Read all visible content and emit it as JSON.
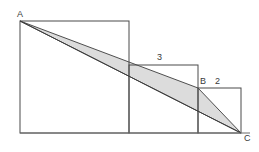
{
  "figure": {
    "background_color": "#ffffff",
    "stroke_color": "#4a4a4a",
    "shade_color": "#dcdcdc",
    "shade_stroke_color": "#3c3c3c",
    "vertices": {
      "A": {
        "label": "A",
        "x": 20,
        "y": 21
      },
      "B": {
        "label": "B",
        "x": 198,
        "y": 88
      },
      "C": {
        "label": "C",
        "x": 241,
        "y": 133
      }
    },
    "side_labels": {
      "medium_square": "3",
      "small_square": "2"
    },
    "squares": [
      {
        "name": "large-square",
        "x": 20,
        "y": 21,
        "width": 109,
        "height": 112
      },
      {
        "name": "medium-square",
        "x": 129,
        "y": 65,
        "width": 69,
        "height": 68
      },
      {
        "name": "small-square",
        "x": 198,
        "y": 88,
        "width": 43,
        "height": 45
      }
    ],
    "shaded_triangle": {
      "name": "triangle-abc",
      "points": "20,21 198,88 241,133"
    },
    "diagonal": {
      "name": "diagonal-a-to-c",
      "x1": 20,
      "y1": 21,
      "x2": 241,
      "y2": 133
    },
    "baseline": {
      "name": "baseline",
      "x1": 20,
      "y1": 133,
      "x2": 250,
      "y2": 133
    }
  }
}
